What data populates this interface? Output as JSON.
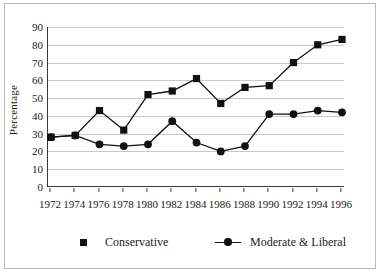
{
  "chart_data": {
    "type": "line",
    "title": "",
    "xlabel": "",
    "ylabel": "Percentage",
    "ylim": [
      0,
      90
    ],
    "yticks": [
      0,
      10,
      20,
      30,
      40,
      50,
      60,
      70,
      80,
      90
    ],
    "grid": true,
    "legend_position": "bottom",
    "categories": [
      "1972",
      "1974",
      "1976",
      "1978",
      "1980",
      "1982",
      "1984",
      "1986",
      "1988",
      "1990",
      "1992",
      "1994",
      "1996"
    ],
    "series": [
      {
        "name": "Conservative",
        "marker": "square",
        "color": "#111111",
        "values": [
          28,
          29,
          43,
          32,
          52,
          54,
          61,
          47,
          56,
          57,
          70,
          80,
          83
        ]
      },
      {
        "name": "Moderate & Liberal",
        "marker": "circle",
        "color": "#111111",
        "values": [
          28,
          29,
          24,
          23,
          24,
          37,
          25,
          20,
          23,
          41,
          41,
          43,
          42
        ]
      }
    ]
  },
  "legend": {
    "items": [
      {
        "label": "Conservative",
        "marker": "square",
        "has_line": false
      },
      {
        "label": "Moderate & Liberal",
        "marker": "circle",
        "has_line": true
      }
    ]
  }
}
